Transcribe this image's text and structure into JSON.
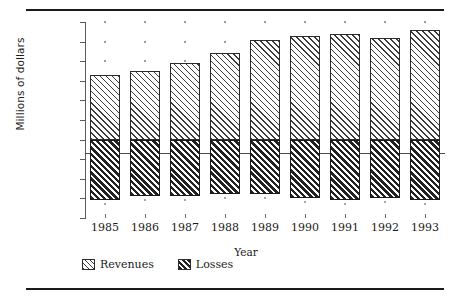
{
  "chart_data": {
    "type": "bar",
    "title": "",
    "subtitle": "",
    "xlabel": "Year",
    "ylabel": "Millions of dollars",
    "categories": [
      "1985",
      "1986",
      "1987",
      "1988",
      "1989",
      "1990",
      "1991",
      "1992",
      "1993"
    ],
    "series": [
      {
        "name": "Revenues",
        "values": [
          825,
          875,
          975,
          1100,
          1275,
          1325,
          1350,
          1300,
          1400
        ]
      },
      {
        "name": "Losses",
        "values": [
          -775,
          -720,
          -720,
          -700,
          -700,
          -750,
          -775,
          -750,
          -775
        ]
      }
    ],
    "ylim": [
      -1000,
      1500
    ],
    "ytick_values": [
      1500,
      1250,
      1000,
      750,
      500,
      250,
      0,
      -250,
      -500,
      -750,
      -1000
    ],
    "ytick_labels": [
      "1500.0",
      "1250.0",
      "1000.0",
      "750.0",
      "500.0",
      "250.0",
      "0.0",
      "(250.0)",
      "(500.0)",
      "(750.0)",
      "(1000.0)"
    ],
    "grid": false,
    "legend_position": "bottom",
    "legend": [
      "Revenues",
      "Losses"
    ],
    "colors": {
      "revenues_hatch": "#3a3a3a",
      "losses_hatch": "#222222",
      "axis": "#5a5a5a",
      "text": "#1a1a1a",
      "background": "#ffffff"
    }
  }
}
